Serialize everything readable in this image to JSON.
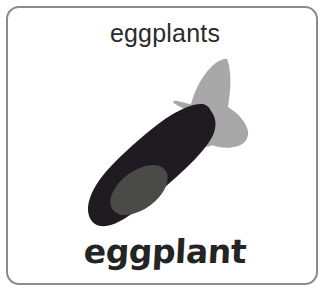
{
  "card": {
    "border_color": "#8a8a8a",
    "background_color": "#ffffff"
  },
  "caption_top": {
    "text": "eggplants",
    "color": "#2b2b2b"
  },
  "caption_bottom": {
    "text": "eggplant",
    "color": "#242424"
  },
  "illustration": {
    "subject": "eggplant",
    "body_color": "#1f1b20",
    "calyx_color": "#a8a8a8",
    "highlight_color": "#4a4a48"
  }
}
